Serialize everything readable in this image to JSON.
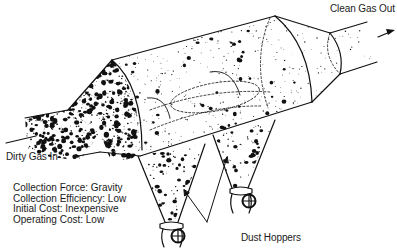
{
  "labels": {
    "clean_gas_out": "Clean Gas Out",
    "dirty_gas_in": "Dirty Gas In",
    "dust_hoppers": "Dust Hoppers"
  },
  "specs": [
    {
      "label": "Collection Force",
      "value": "Gravity",
      "text": "Collection Force: Gravity"
    },
    {
      "label": "Collection Efficiency",
      "value": "Low",
      "text": "Collection Efficiency: Low"
    },
    {
      "label": "Initial Cost",
      "value": "Inexpensive",
      "text": "Initial Cost: Inexpensive"
    },
    {
      "label": "Operating Cost",
      "value": "Low",
      "text": "Operating Cost: Low"
    }
  ],
  "colors": {
    "ink": "#111111",
    "background": "#ffffff"
  }
}
